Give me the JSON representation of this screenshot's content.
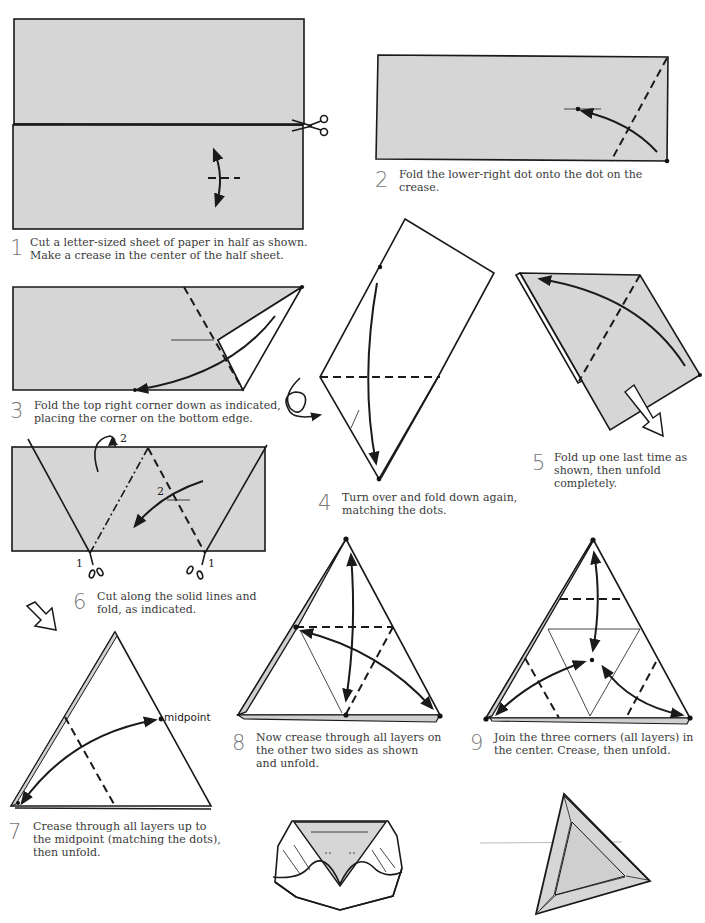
{
  "diagram_title": "Origami tetrahedron from a letter-sized sheet",
  "colors": {
    "paper": "#d6d6d6",
    "line": "#1a1a1a",
    "background": "#ffffff",
    "step_number": "#777777"
  },
  "steps": [
    {
      "number": "1",
      "lines": [
        "Cut a letter-sized sheet of paper in half as shown.",
        "Make a crease in the center of the half sheet."
      ]
    },
    {
      "number": "2",
      "lines": [
        "Fold the lower-right dot onto the dot on the",
        "crease."
      ]
    },
    {
      "number": "3",
      "lines": [
        "Fold the top right corner down as indicated,",
        "placing the corner on the bottom edge."
      ]
    },
    {
      "number": "4",
      "lines": [
        "Turn over and fold down again,",
        "matching the dots."
      ]
    },
    {
      "number": "5",
      "lines": [
        "Fold up one last time as",
        "shown, then unfold",
        "completely."
      ]
    },
    {
      "number": "6",
      "lines": [
        "Cut along the solid lines and",
        "fold, as indicated."
      ]
    },
    {
      "number": "7",
      "lines": [
        "Crease through all layers up to",
        "the midpoint (matching the dots),",
        "then unfold."
      ]
    },
    {
      "number": "8",
      "lines": [
        "Now crease through all layers on",
        "the other two sides as shown",
        "and unfold."
      ]
    },
    {
      "number": "9",
      "lines": [
        "Join the three corners (all layers) in",
        "the center. Crease, then unfold."
      ]
    }
  ],
  "labels": {
    "step6_cut_left": "1",
    "step6_cut_right": "1",
    "step6_fold_back": "2",
    "step6_fold_front": "2",
    "step7_midpoint": "midpoint"
  },
  "icons": {
    "scissors": "scissors-icon",
    "turn_over": "turn-over-icon",
    "hollow_arrow": "hollow-arrow-icon"
  }
}
